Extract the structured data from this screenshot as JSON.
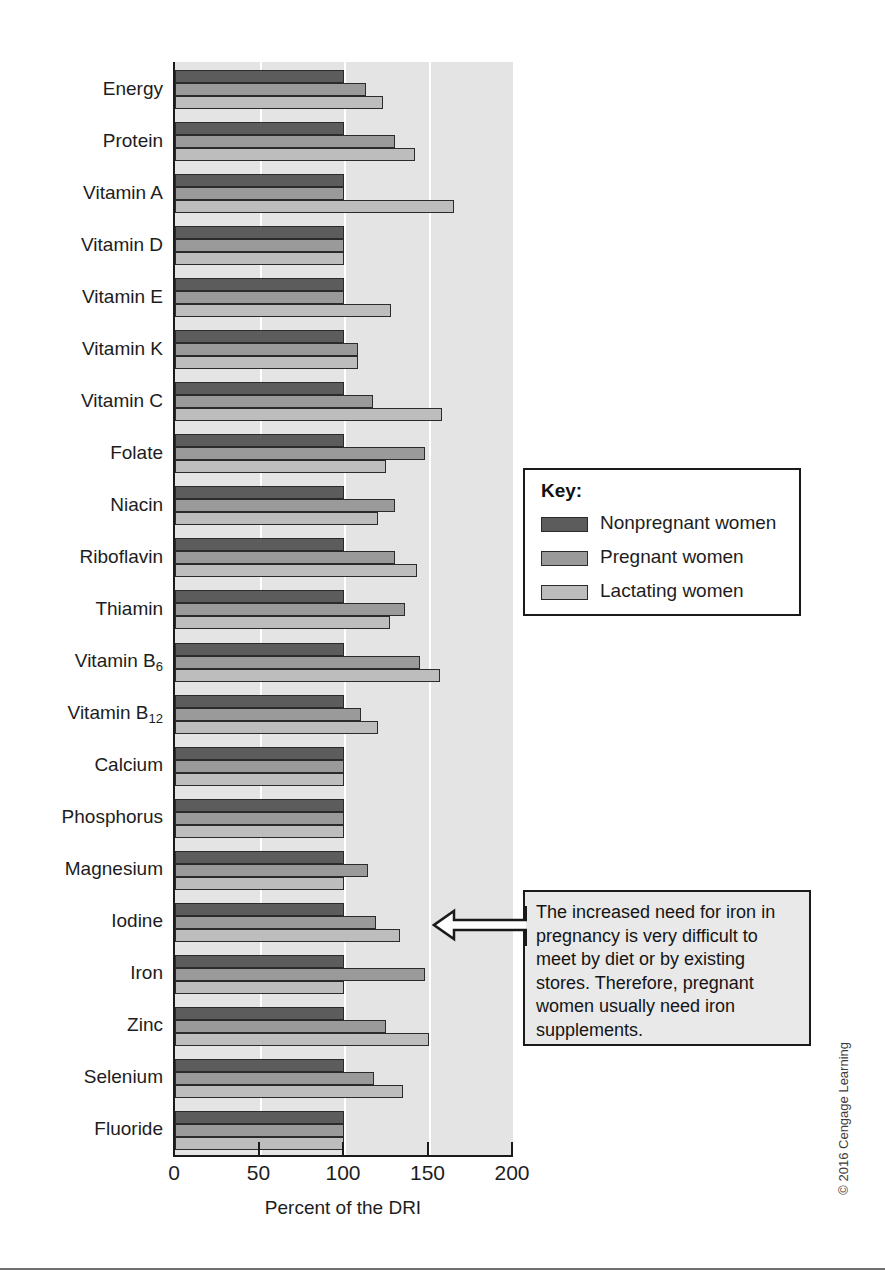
{
  "chart_data": {
    "type": "bar",
    "orientation": "horizontal",
    "title": "",
    "xlabel": "Percent of the DRI",
    "ylabel": "",
    "xlim": [
      0,
      200
    ],
    "xticks": [
      0,
      50,
      100,
      150,
      200
    ],
    "xtick_labels": [
      "0",
      "50",
      "100",
      "150",
      "200"
    ],
    "grid": true,
    "gridlines_at": [
      50,
      100,
      150
    ],
    "legend_position": "right-middle",
    "categories": [
      "Energy",
      "Protein",
      "Vitamin A",
      "Vitamin D",
      "Vitamin E",
      "Vitamin K",
      "Vitamin C",
      "Folate",
      "Niacin",
      "Riboflavin",
      "Thiamin",
      "Vitamin B6",
      "Vitamin B12",
      "Calcium",
      "Phosphorus",
      "Magnesium",
      "Iodine",
      "Iron",
      "Zinc",
      "Selenium",
      "Fluoride"
    ],
    "category_labels_html": [
      "Energy",
      "Protein",
      "Vitamin A",
      "Vitamin D",
      "Vitamin E",
      "Vitamin K",
      "Vitamin C",
      "Folate",
      "Niacin",
      "Riboflavin",
      "Thiamin",
      "Vitamin B<sub>6</sub>",
      "Vitamin B<sub>12</sub>",
      "Calcium",
      "Phosphorus",
      "Magnesium",
      "Iodine",
      "Iron",
      "Zinc",
      "Selenium",
      "Fluoride"
    ],
    "series": [
      {
        "name": "Nonpregnant women",
        "color": "#5c5c5c",
        "values": [
          100,
          100,
          100,
          100,
          100,
          100,
          100,
          100,
          100,
          100,
          100,
          100,
          100,
          100,
          100,
          100,
          100,
          100,
          100,
          100,
          100
        ]
      },
      {
        "name": "Pregnant women",
        "color": "#9a9a9a",
        "values": [
          113,
          130,
          100,
          100,
          100,
          108,
          117,
          148,
          130,
          130,
          136,
          145,
          110,
          100,
          100,
          114,
          119,
          148,
          125,
          118,
          100
        ]
      },
      {
        "name": "Lactating women",
        "color": "#bdbdbd",
        "values": [
          123,
          142,
          165,
          100,
          128,
          108,
          158,
          125,
          120,
          143,
          127,
          157,
          120,
          100,
          100,
          100,
          133,
          100,
          150,
          135,
          100
        ]
      }
    ]
  },
  "legend": {
    "title": "Key:",
    "entries": [
      {
        "label": "Nonpregnant women",
        "swatch": "dark-gray"
      },
      {
        "label": "Pregnant women",
        "swatch": "medium-gray"
      },
      {
        "label": "Lactating women",
        "swatch": "light-gray"
      }
    ]
  },
  "annotation": {
    "text": "The increased need for iron in pregnancy is very difficult to meet by diet or by existing stores. Therefore, pregnant women usually need iron supplements.",
    "points_to": "Iron — Pregnant women bar"
  },
  "axis": {
    "x_title": "Percent of the DRI",
    "x_tick_labels": [
      "0",
      "50",
      "100",
      "150",
      "200"
    ]
  },
  "footer": {
    "copyright": "© 2016 Cengage Learning"
  }
}
